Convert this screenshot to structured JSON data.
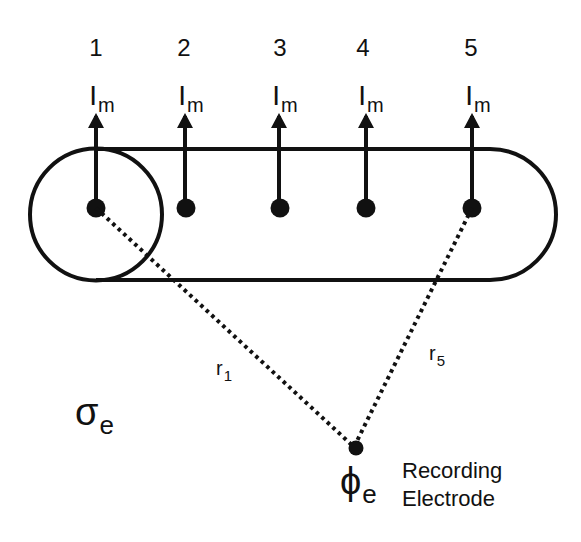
{
  "diagram": {
    "title": "",
    "colors": {
      "stroke": "#111111",
      "background": "#ffffff"
    },
    "nodes": [
      {
        "id": "1",
        "label": "1",
        "current_label": "I",
        "current_subscript": "m",
        "x": 96
      },
      {
        "id": "2",
        "label": "2",
        "current_label": "I",
        "current_subscript": "m",
        "x": 185
      },
      {
        "id": "3",
        "label": "3",
        "current_label": "I",
        "current_subscript": "m",
        "x": 278
      },
      {
        "id": "4",
        "label": "4",
        "current_label": "I",
        "current_subscript": "m",
        "x": 365
      },
      {
        "id": "5",
        "label": "5",
        "current_label": "I",
        "current_subscript": "m",
        "x": 472
      }
    ],
    "distances": [
      {
        "label": "r",
        "subscript": "1",
        "from": "1",
        "to": "electrode"
      },
      {
        "label": "r",
        "subscript": "5",
        "from": "5",
        "to": "electrode"
      }
    ],
    "medium": {
      "symbol": "σ",
      "subscript": "e"
    },
    "electrode": {
      "symbol": "ϕ",
      "subscript": "e",
      "caption_line1": "Recording",
      "caption_line2": "Electrode"
    }
  }
}
